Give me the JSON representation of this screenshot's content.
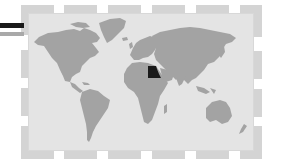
{
  "map": {
    "type": "world-map",
    "highlighted_country": "Egypt",
    "colors": {
      "background": "#e4e4e4",
      "land": "#a3a3a3",
      "highlight": "#1a1a1a",
      "frame": "#d4d4d4",
      "bar_primary": "#1a1a1a",
      "bar_secondary": "#a9a9a9"
    }
  },
  "legend_bars": [
    {
      "name": "black-bar",
      "color": "#1a1a1a"
    },
    {
      "name": "gray-bar",
      "color": "#a9a9a9"
    }
  ]
}
